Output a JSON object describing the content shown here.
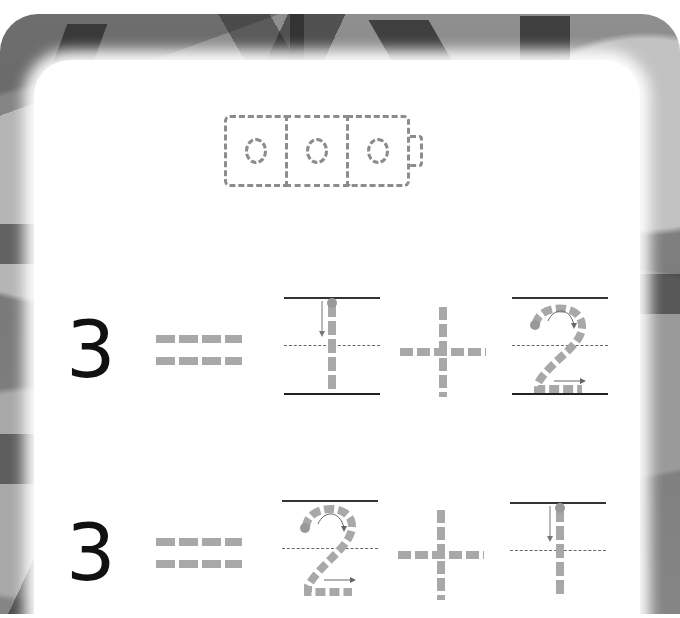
{
  "worksheet": {
    "background": "leaf photo (grayscale)",
    "cube_train": {
      "cubes": 3,
      "style": "dashed tracing outline",
      "icon": "connecting-cubes-icon"
    },
    "equations": [
      {
        "total": "3",
        "equals_glyph": "=",
        "addend_1": "1",
        "plus_glyph": "+",
        "addend_2": "2",
        "addend_1_style": "trace",
        "addend_2_style": "trace"
      },
      {
        "total": "3",
        "equals_glyph": "=",
        "addend_1": "2",
        "plus_glyph": "+",
        "addend_2": "1",
        "addend_1_style": "trace",
        "addend_2_style": "trace"
      }
    ],
    "colors": {
      "trace_gray": "#a8a8a8",
      "outline_gray": "#8c8c8c",
      "ink": "#111111",
      "card": "#ffffff"
    }
  }
}
